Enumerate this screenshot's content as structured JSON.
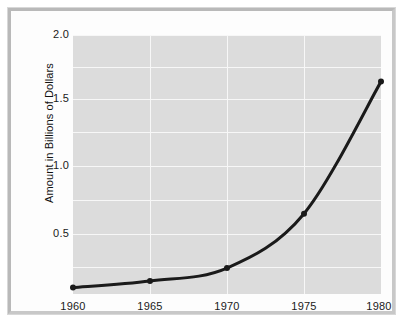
{
  "chart_data": {
    "type": "line",
    "title": "",
    "subtitle": "",
    "xlabel": "",
    "ylabel": "Amount in Billions of Dollars",
    "x": [
      1960,
      1965,
      1970,
      1975,
      1980
    ],
    "values": [
      0.05,
      0.1,
      0.2,
      0.62,
      1.64
    ],
    "series": [
      {
        "name": "Amount",
        "values": [
          0.05,
          0.1,
          0.2,
          0.62,
          1.64
        ]
      }
    ],
    "xtick_labels": [
      "1960",
      "1965",
      "1970",
      "1975",
      "1980"
    ],
    "ytick_labels": [
      "0.5",
      "1.0",
      "1.5",
      "2.0"
    ],
    "ytick_values": [
      0.5,
      1.0,
      1.5,
      2.0
    ],
    "xlim": [
      1960,
      1980
    ],
    "ylim": [
      0.0,
      2.0
    ],
    "grid": true,
    "minor_gridlines_y": [
      0.25,
      0.75,
      1.25,
      1.75
    ],
    "legend": "none",
    "legend_position": "none",
    "marker": "circle",
    "line_color": "#1a1a1a",
    "marker_color": "#1a1a1a",
    "plot_background": "#dcdcdc",
    "gridline_color": "#f7f7f7",
    "figure_background": "#fdfdfd",
    "frame_color": "#bdbdbd",
    "annotations": []
  },
  "axis": {
    "y_title": "Amount in Billions of Dollars"
  }
}
